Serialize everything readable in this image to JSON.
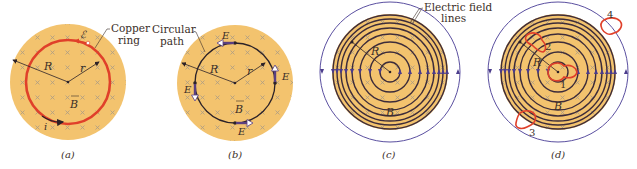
{
  "colors": {
    "field_fill": "#F3C36E",
    "ring": "#E0402A",
    "path": "#2c2228",
    "field_line": "#3d2c3a",
    "arrow": "#4b3c8c",
    "outer_circle": "#5a4fa0",
    "x_mark": "#a89a86",
    "text": "#3a2e28"
  },
  "panels": [
    {
      "id": "a",
      "caption": "(a)",
      "callout": "Copper ring",
      "callout_lines": [
        "Copper",
        "ring"
      ],
      "labels": {
        "R": "R",
        "r": "r",
        "B": "B",
        "emf": "ℰ",
        "i": "i"
      }
    },
    {
      "id": "b",
      "caption": "(b)",
      "callout": "Circular path",
      "callout_lines": [
        "Circular",
        "path"
      ],
      "labels": {
        "R": "R",
        "r": "r",
        "B": "B",
        "E_top": "E",
        "E_right": "E",
        "E_left": "E",
        "E_bottom": "E"
      }
    },
    {
      "id": "c",
      "caption": "(c)",
      "callout": "Electric field lines",
      "callout_lines": [
        "Electric field",
        "lines"
      ],
      "labels": {
        "R": "R",
        "B": "B"
      }
    },
    {
      "id": "d",
      "caption": "(d)",
      "labels": {
        "R": "R",
        "B": "B",
        "loop1": "1",
        "loop2": "2",
        "loop3": "3",
        "loop4": "4"
      }
    }
  ]
}
